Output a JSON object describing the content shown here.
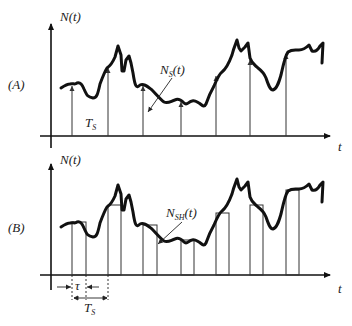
{
  "panels": [
    {
      "id": "A",
      "label": "(A)",
      "y_axis_label": {
        "main": "N",
        "arg": "(t)"
      },
      "x_axis_label": "t",
      "curve_label": {
        "main": "N",
        "sub": "S",
        "arg": "(t)"
      },
      "period_label": {
        "main": "T",
        "sub": "S"
      },
      "representation": "ideal impulse sampling (arrows)"
    },
    {
      "id": "B",
      "label": "(B)",
      "y_axis_label": {
        "main": "N",
        "arg": "(t)"
      },
      "x_axis_label": "t",
      "curve_label": {
        "main": "N",
        "sub": "SH",
        "arg": "(t)"
      },
      "pulse_width_label": "τ",
      "period_label": {
        "main": "T",
        "sub": "S"
      },
      "representation": "sample-and-hold (flat-top pulses)"
    }
  ],
  "sample_positions_px": [
    72,
    108,
    143,
    181,
    216,
    250,
    286
  ],
  "colors": {
    "curve": "#111111",
    "axes": "#111111",
    "samples": "#333333",
    "background": "#ffffff"
  }
}
